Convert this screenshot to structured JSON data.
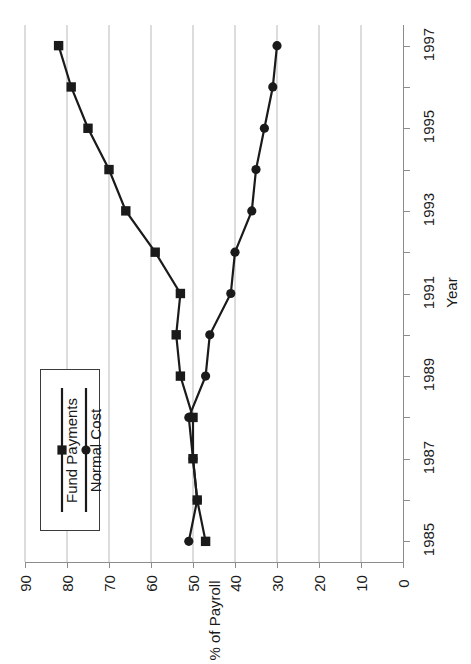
{
  "chart": {
    "title": "",
    "xlabel": "Year",
    "ylabel": "% of Payroll",
    "legend": {
      "items": [
        {
          "label": "Normal Cost",
          "marker": "circle",
          "color": "#1a1a1a"
        },
        {
          "label": "Fund  Payments",
          "marker": "square",
          "color": "#1a1a1a"
        }
      ]
    },
    "year_ticks": [
      "1985",
      "1987",
      "1989",
      "1991",
      "1993",
      "1995",
      "1997"
    ],
    "payroll_ticks": [
      "90",
      "80",
      "70",
      "60",
      "50",
      "40",
      "30",
      "20",
      "10",
      "0"
    ]
  },
  "chart_data": {
    "type": "line",
    "title": "",
    "xlabel": "Year",
    "ylabel": "% of Payroll",
    "orientation": "year-vertical-ascending",
    "grid": true,
    "legend_position": "lower-left",
    "xlim": [
      1984.5,
      1997.5
    ],
    "ylim": [
      0,
      90
    ],
    "y_axis_reversed": true,
    "x": [
      1985,
      1986,
      1987,
      1988,
      1989,
      1990,
      1991,
      1992,
      1993,
      1994,
      1995,
      1996,
      1997
    ],
    "categories": [
      "1985",
      "1986",
      "1987",
      "1988",
      "1989",
      "1990",
      "1991",
      "1992",
      "1993",
      "1994",
      "1995",
      "1996",
      "1997"
    ],
    "series": [
      {
        "name": "Normal Cost",
        "marker": "circle",
        "color": "#1a1a1a",
        "values": [
          51,
          49,
          50,
          51,
          47,
          46,
          41,
          40,
          36,
          35,
          33,
          31,
          30
        ]
      },
      {
        "name": "Fund  Payments",
        "marker": "square",
        "color": "#1a1a1a",
        "values": [
          47,
          49,
          50,
          50,
          53,
          54,
          53,
          59,
          66,
          70,
          75,
          79,
          82
        ]
      }
    ]
  }
}
